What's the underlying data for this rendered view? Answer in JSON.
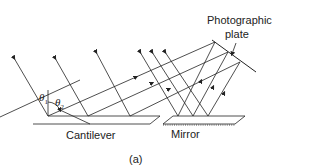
{
  "diagram": {
    "labels": {
      "plate_line1": "Photographic",
      "plate_line2": "plate",
      "cantilever": "Cantilever",
      "mirror": "Mirror",
      "panel": "(a)",
      "theta1": "θ",
      "theta1_sub": "1",
      "theta2": "θ",
      "theta2_sub": "2"
    },
    "colors": {
      "line": "#222222",
      "background": "#ffffff"
    }
  }
}
